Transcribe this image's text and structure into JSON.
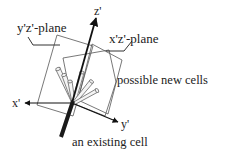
{
  "diagram": {
    "labels": {
      "yz_plane": "y'z'-plane",
      "xz_plane": "x'z'-plane",
      "new_cells": "possible new cells",
      "existing_cell": "an existing cell",
      "x_axis": "x'",
      "y_axis": "y'",
      "z_axis": "z'"
    },
    "colors": {
      "ink": "#222222",
      "plane": "#555555",
      "cylinder": "#888888",
      "background": "#ffffff"
    }
  }
}
